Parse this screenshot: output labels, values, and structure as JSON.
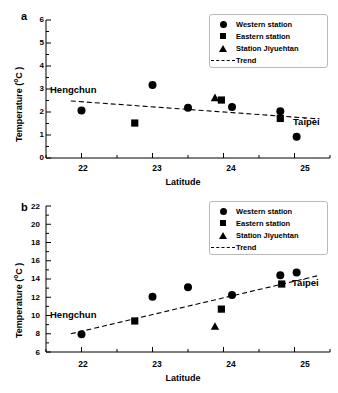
{
  "figure": {
    "background": "#ffffff",
    "foreground": "#000000"
  },
  "panels": [
    {
      "letter": "a",
      "xlabel": "Latitude",
      "ylabel_main": "Temperature (",
      "ylabel_unit": "o",
      "ylabel_tail": "C )",
      "annotations": [
        {
          "text": "Hengchun"
        },
        {
          "text": "Taipei"
        }
      ],
      "legend": [
        {
          "symbol": "circle",
          "label": "Western station"
        },
        {
          "symbol": "square",
          "label": "Eastern station"
        },
        {
          "symbol": "triangle",
          "label": "Station Jiyuehtan"
        },
        {
          "symbol": "dashed-line",
          "label": "Trend"
        }
      ],
      "yticks": [
        "6",
        "5",
        "4",
        "3",
        "2",
        "1",
        "0"
      ],
      "xticks": [
        "22",
        "23",
        "24",
        "25"
      ]
    },
    {
      "letter": "b",
      "xlabel": "Latitude",
      "ylabel_main": "Temperature (",
      "ylabel_unit": "o",
      "ylabel_tail": "C )",
      "annotations": [
        {
          "text": "Hengchun"
        },
        {
          "text": "Taipei"
        }
      ],
      "legend": [
        {
          "symbol": "circle",
          "label": "Western station"
        },
        {
          "symbol": "square",
          "label": "Eastern station"
        },
        {
          "symbol": "triangle",
          "label": "Station Jiyuehtan"
        },
        {
          "symbol": "dashed-line",
          "label": "Trend"
        }
      ],
      "yticks": [
        "22",
        "20",
        "18",
        "16",
        "14",
        "12",
        "10",
        "8",
        "6"
      ],
      "xticks": [
        "22",
        "23",
        "24",
        "25"
      ]
    }
  ],
  "chart_data": [
    {
      "type": "scatter",
      "panel": "a",
      "title": "",
      "xlabel": "Latitude",
      "ylabel": "Temperature ( oC )",
      "xlim": [
        21.5,
        25.5
      ],
      "ylim": [
        0,
        6
      ],
      "xticks": [
        22,
        23,
        24,
        25
      ],
      "yticks": [
        0,
        1,
        2,
        3,
        4,
        5,
        6
      ],
      "xminor_step": 0.5,
      "yminor_step": 0.5,
      "grid": false,
      "legend_position": "top-right",
      "annotations": [
        {
          "text": "Hengchun",
          "x": 21.72,
          "y": 2.93
        },
        {
          "text": "Taipei",
          "x": 25.05,
          "y": 1.58
        }
      ],
      "series": [
        {
          "name": "Western station",
          "marker": "circle",
          "points": [
            {
              "x": 22.0,
              "y": 2.07
            },
            {
              "x": 23.0,
              "y": 3.17
            },
            {
              "x": 23.5,
              "y": 2.18
            },
            {
              "x": 24.12,
              "y": 2.22
            },
            {
              "x": 24.8,
              "y": 2.03
            },
            {
              "x": 25.03,
              "y": 0.92
            }
          ]
        },
        {
          "name": "Eastern station",
          "marker": "square",
          "points": [
            {
              "x": 22.75,
              "y": 1.52
            },
            {
              "x": 23.97,
              "y": 2.52
            },
            {
              "x": 24.8,
              "y": 1.72
            }
          ]
        },
        {
          "name": "Station Jiyuehtan",
          "marker": "triangle",
          "points": [
            {
              "x": 23.88,
              "y": 2.62
            }
          ]
        },
        {
          "name": "Trend",
          "marker": "dashed-line",
          "line": {
            "x0": 21.85,
            "y0": 2.48,
            "x1": 25.35,
            "y1": 1.7
          }
        }
      ]
    },
    {
      "type": "scatter",
      "panel": "b",
      "title": "",
      "xlabel": "Latitude",
      "ylabel": "Temperature ( oC )",
      "xlim": [
        21.5,
        25.5
      ],
      "ylim": [
        6,
        22
      ],
      "xticks": [
        22,
        23,
        24,
        25
      ],
      "yticks": [
        6,
        8,
        10,
        12,
        14,
        16,
        18,
        20,
        22
      ],
      "xminor_step": 0.5,
      "yminor_step": 1,
      "grid": false,
      "legend_position": "top-right",
      "annotations": [
        {
          "text": "Hengchun",
          "x": 21.72,
          "y": 9.9
        },
        {
          "text": "Taipei",
          "x": 25.05,
          "y": 13.6
        }
      ],
      "series": [
        {
          "name": "Western station",
          "marker": "circle",
          "points": [
            {
              "x": 22.0,
              "y": 7.95
            },
            {
              "x": 23.0,
              "y": 12.05
            },
            {
              "x": 23.5,
              "y": 13.1
            },
            {
              "x": 24.12,
              "y": 12.25
            },
            {
              "x": 24.8,
              "y": 14.4
            },
            {
              "x": 25.03,
              "y": 14.7
            }
          ]
        },
        {
          "name": "Eastern station",
          "marker": "square",
          "points": [
            {
              "x": 22.75,
              "y": 9.4
            },
            {
              "x": 23.97,
              "y": 10.7
            },
            {
              "x": 24.82,
              "y": 13.45
            }
          ]
        },
        {
          "name": "Station Jiyuehtan",
          "marker": "triangle",
          "points": [
            {
              "x": 23.88,
              "y": 8.8
            }
          ]
        },
        {
          "name": "Trend",
          "marker": "dashed-line",
          "line": {
            "x0": 21.85,
            "y0": 8.0,
            "x1": 25.35,
            "y1": 14.4
          }
        }
      ]
    }
  ]
}
